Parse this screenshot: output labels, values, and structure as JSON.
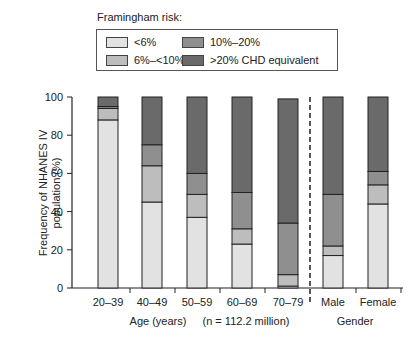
{
  "chart_data": {
    "type": "bar",
    "stacked": true,
    "title": "Framingham risk:",
    "xlabel": "Age (years)",
    "xlabel_note": "(n = 112.2 million)",
    "xlabel_group2": "Gender",
    "ylabel": "Frequency of NHANES IV population (%)",
    "ylim": [
      0,
      100
    ],
    "yticks": [
      0,
      20,
      40,
      60,
      80,
      100
    ],
    "grid": false,
    "legend_position": "top",
    "categories": [
      "20–39",
      "40–49",
      "50–59",
      "60–69",
      "70–79",
      "Male",
      "Female"
    ],
    "series": [
      {
        "name": "<6%",
        "color": "#e2e2e2",
        "values": [
          88,
          45,
          37,
          23,
          1,
          17,
          44
        ]
      },
      {
        "name": "6%–<10%",
        "color": "#bdbdbd",
        "values": [
          6,
          19,
          12,
          8,
          6,
          5,
          10
        ]
      },
      {
        "name": "10%–20%",
        "color": "#8f8f8f",
        "values": [
          1,
          11,
          11,
          19,
          27,
          27,
          7
        ]
      },
      {
        "name": ">20% CHD equivalent",
        "color": "#6a6a6a",
        "values": [
          5,
          25,
          40,
          50,
          65,
          51,
          39
        ]
      }
    ],
    "annotations": [
      "dashed divider between 70–79 and Male"
    ]
  },
  "legend": {
    "title": "Framingham risk:",
    "items": [
      {
        "label": "<6%",
        "color": "#e2e2e2"
      },
      {
        "label": "10%–20%",
        "color": "#8f8f8f"
      },
      {
        "label": "6%–<10%",
        "color": "#bdbdbd"
      },
      {
        "label": ">20% CHD equivalent",
        "color": "#6a6a6a"
      }
    ]
  },
  "axis": {
    "ylabel_line1": "Frequency of NHANES IV",
    "ylabel_line2": "population (%)",
    "xlabel": "Age (years)",
    "note": "(n = 112.2 million)",
    "group2": "Gender"
  }
}
